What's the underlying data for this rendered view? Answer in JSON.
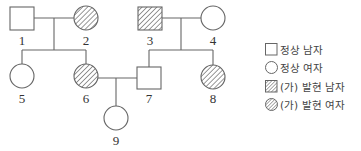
{
  "pedigree": {
    "individuals": [
      {
        "id": "1",
        "label": "1",
        "sex": "male",
        "affected": false
      },
      {
        "id": "2",
        "label": "2",
        "sex": "female",
        "affected": true
      },
      {
        "id": "3",
        "label": "3",
        "sex": "male",
        "affected": true
      },
      {
        "id": "4",
        "label": "4",
        "sex": "female",
        "affected": false
      },
      {
        "id": "5",
        "label": "5",
        "sex": "female",
        "affected": false
      },
      {
        "id": "6",
        "label": "6",
        "sex": "female",
        "affected": true
      },
      {
        "id": "7",
        "label": "7",
        "sex": "male",
        "affected": false
      },
      {
        "id": "8",
        "label": "8",
        "sex": "female",
        "affected": true
      },
      {
        "id": "9",
        "label": "9",
        "sex": "female",
        "affected": false
      }
    ],
    "couples": [
      [
        "1",
        "2"
      ],
      [
        "3",
        "4"
      ],
      [
        "6",
        "7"
      ]
    ],
    "children": {
      "1-2": [
        "5",
        "6"
      ],
      "3-4": [
        "7",
        "8"
      ],
      "6-7": [
        "9"
      ]
    }
  },
  "legend": {
    "items": [
      {
        "symbol": "square-empty",
        "label": "정상 남자"
      },
      {
        "symbol": "circle-empty",
        "label": "정상 여자"
      },
      {
        "symbol": "square-hatched",
        "label": "(가) 발현 남자"
      },
      {
        "symbol": "circle-hatched",
        "label": "(가) 발현 여자"
      }
    ]
  },
  "colors": {
    "stroke": "#555555",
    "hatch": "#555555",
    "background": "#ffffff"
  }
}
